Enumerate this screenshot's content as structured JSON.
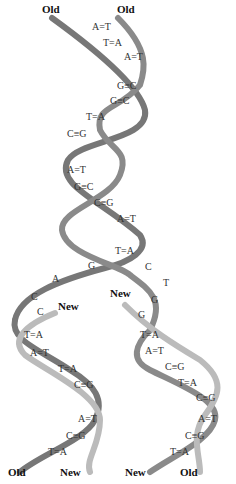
{
  "labels": {
    "top_left": "Old",
    "top_right": "Old",
    "new_left": "New",
    "new_right": "New",
    "bottom": [
      "Old",
      "New",
      "New",
      "Old"
    ]
  },
  "parent_pairs": [
    "A=T",
    "T=A",
    "A=T",
    "G≡C",
    "G≡C",
    "T=A",
    "C≡G",
    "A=T",
    "G≡C",
    "C≡G",
    "A=T",
    "T=A"
  ],
  "fork_left_bases": [
    "G",
    "A",
    "C",
    "C"
  ],
  "fork_right_bases": [
    "C",
    "T",
    "G",
    "G"
  ],
  "left_daughter_pairs": [
    "T=A",
    "A=T",
    "T=A",
    "C≡G",
    "A=T",
    "C≡G",
    "T=A"
  ],
  "right_daughter_pairs": [
    "T=A",
    "A=T",
    "C≡G",
    "T=A",
    "C≡G",
    "A=T",
    "C≡G",
    "T=A"
  ],
  "colors": {
    "old_strand": "#8a8a8a",
    "new_strand": "#c4c4c4",
    "edge": "#555555"
  }
}
